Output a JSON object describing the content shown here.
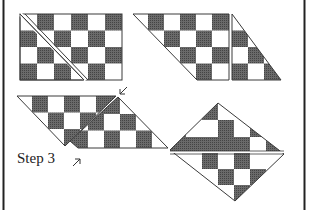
{
  "diagram": {
    "step_label": "Step 3",
    "colors": {
      "dark": "#5a5a5a",
      "light": "#ffffff",
      "line": "#3a3a3a",
      "border": "#222222"
    },
    "figures": [
      {
        "id": "fig-1",
        "description": "6x4 checkerboard rectangle with diagonal cut line from top-left corner"
      },
      {
        "id": "fig-2",
        "description": "Parallelogram checkerboard with triangle piece separated on right"
      },
      {
        "id": "fig-3",
        "description": "Two triangular checkerboard pieces being joined along diagonal, arrows indicate seam"
      },
      {
        "id": "fig-4",
        "description": "Assembled checkerboard rotated on point forming diamond"
      }
    ]
  }
}
